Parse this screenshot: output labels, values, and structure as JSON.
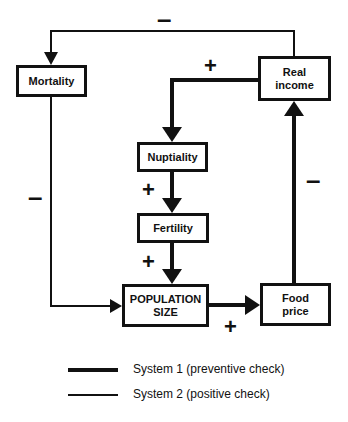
{
  "diagram": {
    "nodes": [
      {
        "id": "mortality",
        "label": "Mortality"
      },
      {
        "id": "real_income",
        "label": "Real\nincome"
      },
      {
        "id": "nuptiality",
        "label": "Nuptiality"
      },
      {
        "id": "fertility",
        "label": "Fertility"
      },
      {
        "id": "population_size",
        "label": "POPULATION\nSIZE"
      },
      {
        "id": "food_price",
        "label": "Food\nprice"
      }
    ],
    "edges": [
      {
        "from": "real_income",
        "to": "mortality",
        "sign": "–",
        "system": "System 2"
      },
      {
        "from": "real_income",
        "to": "nuptiality",
        "sign": "+",
        "system": "System 1"
      },
      {
        "from": "nuptiality",
        "to": "fertility",
        "sign": "+",
        "system": "System 1"
      },
      {
        "from": "fertility",
        "to": "population_size",
        "sign": "+",
        "system": "System 1"
      },
      {
        "from": "mortality",
        "to": "population_size",
        "sign": "–",
        "system": "System 2"
      },
      {
        "from": "population_size",
        "to": "food_price",
        "sign": "+",
        "system": "System 1"
      },
      {
        "from": "food_price",
        "to": "real_income",
        "sign": "–",
        "system": "System 1"
      }
    ],
    "signs": {
      "top_minus": "–",
      "left_minus": "–",
      "right_minus": "–",
      "income_to_nuptiality_plus": "+",
      "nuptiality_to_fertility_plus": "+",
      "fertility_to_population_plus": "+",
      "population_to_food_plus": "+"
    }
  },
  "legend": {
    "items": [
      {
        "label": "System 1 (preventive check)",
        "style": "thick"
      },
      {
        "label": "System 2 (positive check)",
        "style": "thin"
      }
    ]
  }
}
